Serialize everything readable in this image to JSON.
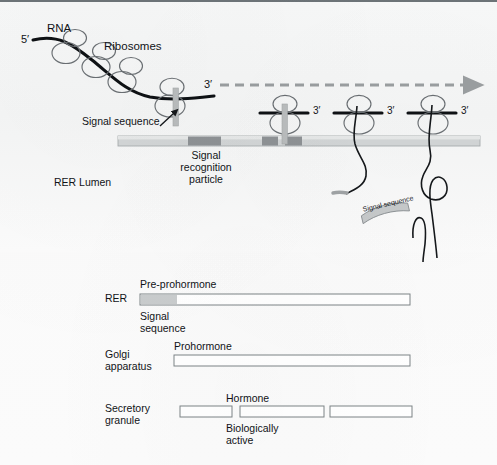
{
  "figure": {
    "title_region": "protein-secretory-pathway-diagram",
    "background_color": "#fafafa",
    "ink_color": "#111317",
    "membrane_color": "#cfd2d3",
    "membrane_dark_color": "#9a9ea0",
    "signal_sequence_color": "#b9bcbd",
    "bar_outline_color": "#7d8386"
  },
  "upper": {
    "rna_label": "RNA",
    "five_prime_label": "5′",
    "ribosomes_label": "Ribosomes",
    "signal_sequence_label": "Signal sequence",
    "srp_label_line1": "Signal",
    "srp_label_line2": "recognition",
    "srp_label_line3": "particle",
    "rer_lumen_label": "RER Lumen",
    "three_prime_labels": [
      "3′",
      "3′",
      "3′",
      "3′"
    ],
    "cleaved_signal_sequence_label": "Signal sequence"
  },
  "lower": {
    "rows": [
      {
        "organelle": "RER",
        "product_label": "Pre-prohormone",
        "sub_label_line1": "Signal",
        "sub_label_line2": "sequence",
        "bars": [
          {
            "x": 140,
            "width": 270,
            "signal_width": 36
          }
        ]
      },
      {
        "organelle_line1": "Golgi",
        "organelle_line2": "apparatus",
        "product_label": "Prohormone",
        "bars": [
          {
            "x": 174,
            "width": 236,
            "signal_width": 0
          }
        ]
      },
      {
        "organelle_line1": "Secretory",
        "organelle_line2": "granule",
        "product_label": "Hormone",
        "sub_label_line1": "Biologically",
        "sub_label_line2": "active",
        "bars": [
          {
            "x": 180,
            "width": 52,
            "signal_width": 0
          },
          {
            "x": 240,
            "width": 84,
            "signal_width": 0
          },
          {
            "x": 330,
            "width": 82,
            "signal_width": 0
          }
        ]
      }
    ]
  }
}
